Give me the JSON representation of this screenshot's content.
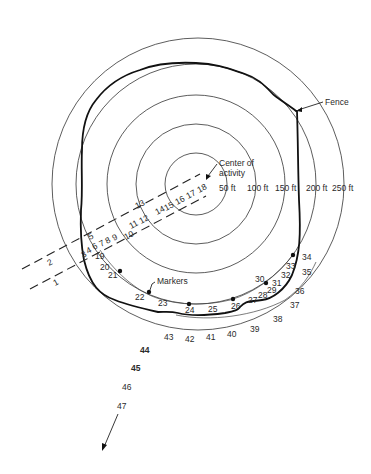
{
  "diagram": {
    "center_label": "Center of\nactivity",
    "center_label_lines": [
      "Center of",
      "activity"
    ],
    "fence_label": "Fence",
    "markers_label": "Markers",
    "rings": [
      {
        "label": "50 ft",
        "radius_ft": 50
      },
      {
        "label": "100 ft",
        "radius_ft": 100
      },
      {
        "label": "150 ft",
        "radius_ft": 150
      },
      {
        "label": "200 ft",
        "radius_ft": 200
      },
      {
        "label": "250 ft",
        "radius_ft": 250
      }
    ],
    "corridor_points": {
      "upper_row": [
        "5",
        "13"
      ],
      "middle_row": [
        "3",
        "4",
        "6",
        "7",
        "8",
        "9",
        "11",
        "12",
        "14",
        "15",
        "16",
        "17",
        "18"
      ],
      "lower_row": [
        "1",
        "2",
        "10"
      ]
    },
    "perimeter_points": [
      "19",
      "20",
      "21",
      "22",
      "23",
      "24",
      "25",
      "26",
      "27",
      "28",
      "29",
      "30",
      "31",
      "32",
      "33",
      "34",
      "35",
      "36",
      "37",
      "38",
      "39",
      "40",
      "41",
      "42",
      "43"
    ],
    "exit_points": [
      "44",
      "45",
      "46",
      "47"
    ],
    "markers_at_points": [
      "21",
      "22",
      "24",
      "26",
      "30",
      "34"
    ],
    "colors": {
      "line": "#222222",
      "background": "#ffffff"
    }
  }
}
